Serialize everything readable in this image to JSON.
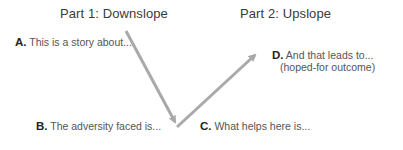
{
  "diagram": {
    "part1_title": "Part 1: Downslope",
    "part2_title": "Part 2: Upslope",
    "steps": [
      {
        "letter": "A.",
        "text": "This is a story about..."
      },
      {
        "letter": "B.",
        "text": "The adversity faced is..."
      },
      {
        "letter": "C.",
        "text": "What helps here is..."
      },
      {
        "letter": "D.",
        "text": "And that leads to...",
        "subtext": "(hoped-for outcome)"
      }
    ],
    "arrow_color": "#a9a9a9"
  }
}
